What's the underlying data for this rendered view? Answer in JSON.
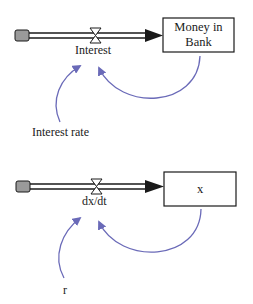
{
  "diagram": {
    "type": "stock-and-flow",
    "colors": {
      "stroke": "#1a1a1a",
      "link": "#6a6ab8",
      "cloud": "#9a9a9a"
    },
    "model1": {
      "flow_label": "Interest",
      "stock_label": "Money in Bank",
      "stock_line1": "Money in",
      "stock_line2": "Bank",
      "auxiliary_label": "Interest rate"
    },
    "model2": {
      "flow_label": "dx/dt",
      "stock_label": "x",
      "auxiliary_label": "r"
    }
  }
}
